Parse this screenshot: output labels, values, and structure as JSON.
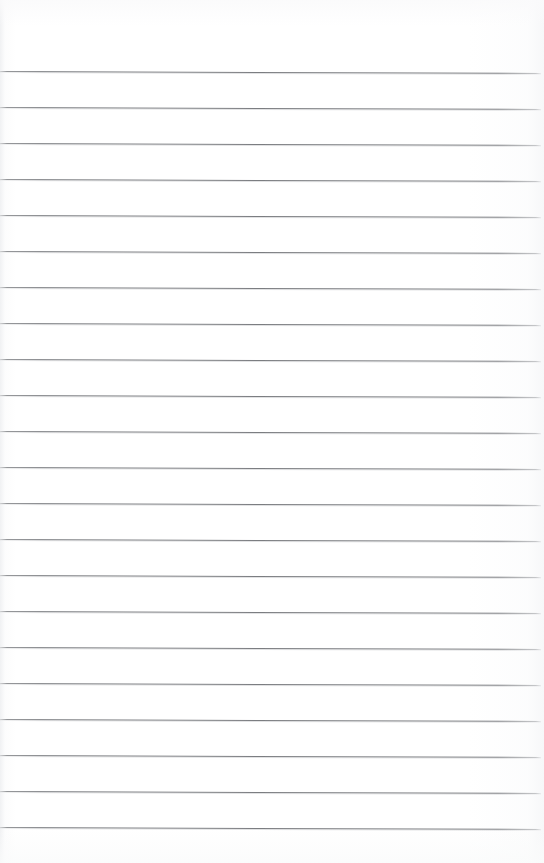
{
  "document": {
    "kind": "scanned-blank-ruled-page",
    "page_label": "",
    "visible_text": "",
    "background_color": "#ffffff",
    "rule_color": "#74767a",
    "ruling": {
      "line_count": 22,
      "first_line_y": 71,
      "line_spacing_px": 36,
      "last_line_y": 827,
      "line_thickness_px": 1,
      "line_start_x": 0,
      "line_end_x": 541,
      "skew_px_over_width": 2,
      "top_margin_px": 71,
      "bottom_margin_px": 36
    },
    "lines": [
      {
        "index": 1,
        "y": 71,
        "text": ""
      },
      {
        "index": 2,
        "y": 107,
        "text": ""
      },
      {
        "index": 3,
        "y": 143,
        "text": ""
      },
      {
        "index": 4,
        "y": 179,
        "text": ""
      },
      {
        "index": 5,
        "y": 215,
        "text": ""
      },
      {
        "index": 6,
        "y": 251,
        "text": ""
      },
      {
        "index": 7,
        "y": 287,
        "text": ""
      },
      {
        "index": 8,
        "y": 323,
        "text": ""
      },
      {
        "index": 9,
        "y": 359,
        "text": ""
      },
      {
        "index": 10,
        "y": 395,
        "text": ""
      },
      {
        "index": 11,
        "y": 431,
        "text": ""
      },
      {
        "index": 12,
        "y": 467,
        "text": ""
      },
      {
        "index": 13,
        "y": 503,
        "text": ""
      },
      {
        "index": 14,
        "y": 539,
        "text": ""
      },
      {
        "index": 15,
        "y": 575,
        "text": ""
      },
      {
        "index": 16,
        "y": 611,
        "text": ""
      },
      {
        "index": 17,
        "y": 647,
        "text": ""
      },
      {
        "index": 18,
        "y": 683,
        "text": ""
      },
      {
        "index": 19,
        "y": 719,
        "text": ""
      },
      {
        "index": 20,
        "y": 755,
        "text": ""
      },
      {
        "index": 21,
        "y": 791,
        "text": ""
      },
      {
        "index": 22,
        "y": 827,
        "text": ""
      }
    ]
  }
}
